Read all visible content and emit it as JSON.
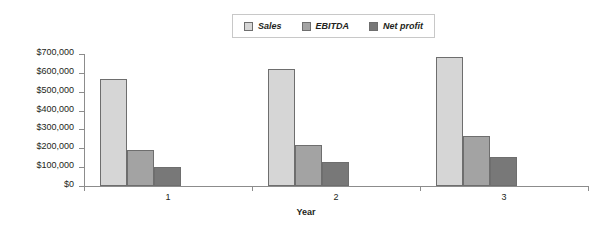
{
  "chart_data": {
    "type": "bar",
    "title": "",
    "subtitle": "",
    "xlabel": "Year",
    "ylabel": "",
    "categories": [
      "1",
      "2",
      "3"
    ],
    "series": [
      {
        "name": "Sales",
        "values": [
          570000,
          620000,
          685000
        ],
        "color": "#d6d6d6"
      },
      {
        "name": "EBITDA",
        "values": [
          190000,
          215000,
          265000
        ],
        "color": "#a3a3a3"
      },
      {
        "name": "Net profit",
        "values": [
          100000,
          130000,
          155000
        ],
        "color": "#787878"
      }
    ],
    "ylim": [
      0,
      700000
    ],
    "ytick_labels": [
      "$700,000",
      "$600,000",
      "$500,000",
      "$400,000",
      "$300,000",
      "$200,000",
      "$100,000",
      "$0"
    ],
    "ytick_values": [
      700000,
      600000,
      500000,
      400000,
      300000,
      200000,
      100000,
      0
    ],
    "grid": false,
    "legend_position": "top-center",
    "legend_entries": [
      "Sales",
      "EBITDA",
      "Net profit"
    ],
    "annotations": []
  },
  "legend": {
    "items": [
      {
        "label": "Sales",
        "swatch_color": "#d6d6d6",
        "icon": "legend-swatch-icon"
      },
      {
        "label": "EBITDA",
        "swatch_color": "#a3a3a3",
        "icon": "legend-swatch-icon"
      },
      {
        "label": "Net profit",
        "swatch_color": "#787878",
        "icon": "legend-swatch-icon"
      }
    ]
  },
  "axes": {
    "x_title": "Year",
    "x_tick_labels": [
      "1",
      "2",
      "3"
    ],
    "y_tick_labels": [
      "$700,000",
      "$600,000",
      "$500,000",
      "$400,000",
      "$300,000",
      "$200,000",
      "$100,000",
      "$0"
    ]
  },
  "colors": {
    "sales": "#d6d6d6",
    "ebitda": "#a3a3a3",
    "net_profit": "#787878",
    "axis": "#8c8c8c",
    "bar_outline": "#6e6e6e",
    "text": "#231f20",
    "background": "#ffffff"
  }
}
